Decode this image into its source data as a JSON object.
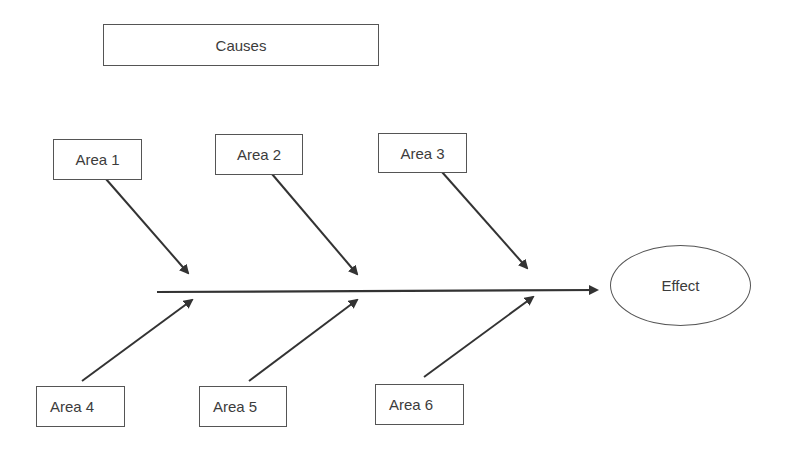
{
  "diagram": {
    "type": "fishbone",
    "header": {
      "label": "Causes"
    },
    "effect": {
      "label": "Effect"
    },
    "causes_top": [
      {
        "label": "Area 1"
      },
      {
        "label": "Area 2"
      },
      {
        "label": "Area 3"
      }
    ],
    "causes_bottom": [
      {
        "label": "Area 4"
      },
      {
        "label": "Area 5"
      },
      {
        "label": "Area 6"
      }
    ],
    "colors": {
      "line": "#333333",
      "border": "#555555",
      "text": "#3c3c3c"
    }
  }
}
